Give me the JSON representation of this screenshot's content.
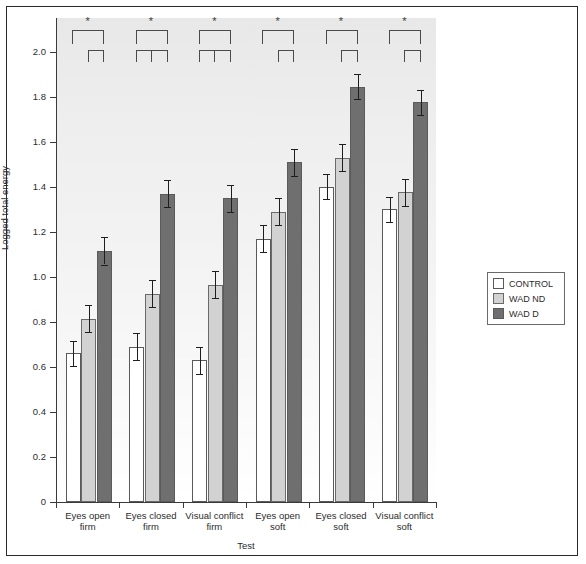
{
  "chart_data": {
    "type": "bar",
    "title": "",
    "xlabel": "Test",
    "ylabel": "Logged total energy",
    "ylim": [
      0,
      2.15
    ],
    "grid": false,
    "legend_position": "right",
    "ytick_labels": [
      "0",
      "0.2",
      "0.4",
      "0.6",
      "0.8",
      "1.0",
      "1.2",
      "1.4",
      "1.6",
      "1.8",
      "2.0"
    ],
    "ytick_values": [
      0,
      0.2,
      0.4,
      0.6,
      0.8,
      1.0,
      1.2,
      1.4,
      1.6,
      1.8,
      2.0
    ],
    "categories": [
      "Eyes open firm",
      "Eyes closed firm",
      "Visual conflict firm",
      "Eyes open soft",
      "Eyes closed soft",
      "Visual conflict soft"
    ],
    "category_lines": [
      [
        "Eyes open",
        "firm"
      ],
      [
        "Eyes closed",
        "firm"
      ],
      [
        "Visual conflict",
        "firm"
      ],
      [
        "Eyes open",
        "soft"
      ],
      [
        "Eyes closed",
        "soft"
      ],
      [
        "Visual conflict",
        "soft"
      ]
    ],
    "series": [
      {
        "name": "CONTROL",
        "color": "#ffffff",
        "values": [
          0.66,
          0.69,
          0.63,
          1.17,
          1.4,
          1.3
        ],
        "errors": [
          0.055,
          0.06,
          0.06,
          0.06,
          0.055,
          0.055
        ]
      },
      {
        "name": "WAD ND",
        "color": "#d2d2d2",
        "values": [
          0.815,
          0.925,
          0.965,
          1.29,
          1.53,
          1.375
        ],
        "errors": [
          0.06,
          0.06,
          0.06,
          0.06,
          0.06,
          0.06
        ]
      },
      {
        "name": "WAD D",
        "color": "#6f6f6f",
        "values": [
          1.115,
          1.37,
          1.35,
          1.51,
          1.845,
          1.775
        ],
        "errors": [
          0.06,
          0.06,
          0.06,
          0.06,
          0.055,
          0.055
        ]
      }
    ],
    "annotations": [
      {
        "group": 0,
        "marker": "*",
        "upper_span": [
          0,
          2
        ],
        "lower_span": [
          1,
          2
        ],
        "lower_has_center_tick": false
      },
      {
        "group": 1,
        "marker": "*",
        "upper_span": [
          0,
          2
        ],
        "lower_span": [
          0,
          2
        ],
        "lower_has_center_tick": true
      },
      {
        "group": 2,
        "marker": "*",
        "upper_span": [
          0,
          2
        ],
        "lower_span": [
          0,
          2
        ],
        "lower_has_center_tick": true
      },
      {
        "group": 3,
        "marker": "*",
        "upper_span": [
          0,
          2
        ],
        "lower_span": [
          1,
          2
        ],
        "lower_has_center_tick": false
      },
      {
        "group": 4,
        "marker": "*",
        "upper_span": [
          0,
          2
        ],
        "lower_span": [
          1,
          2
        ],
        "lower_has_center_tick": false
      },
      {
        "group": 5,
        "marker": "*",
        "upper_span": [
          0,
          2
        ],
        "lower_span": [
          1,
          2
        ],
        "lower_has_center_tick": false
      }
    ]
  },
  "legend": {
    "items": [
      {
        "label": "CONTROL",
        "key": "control"
      },
      {
        "label": "WAD ND",
        "key": "wadnd"
      },
      {
        "label": "WAD D",
        "key": "wadd"
      }
    ]
  },
  "axes": {
    "y_title": "Logged total energy",
    "x_title": "Test"
  }
}
